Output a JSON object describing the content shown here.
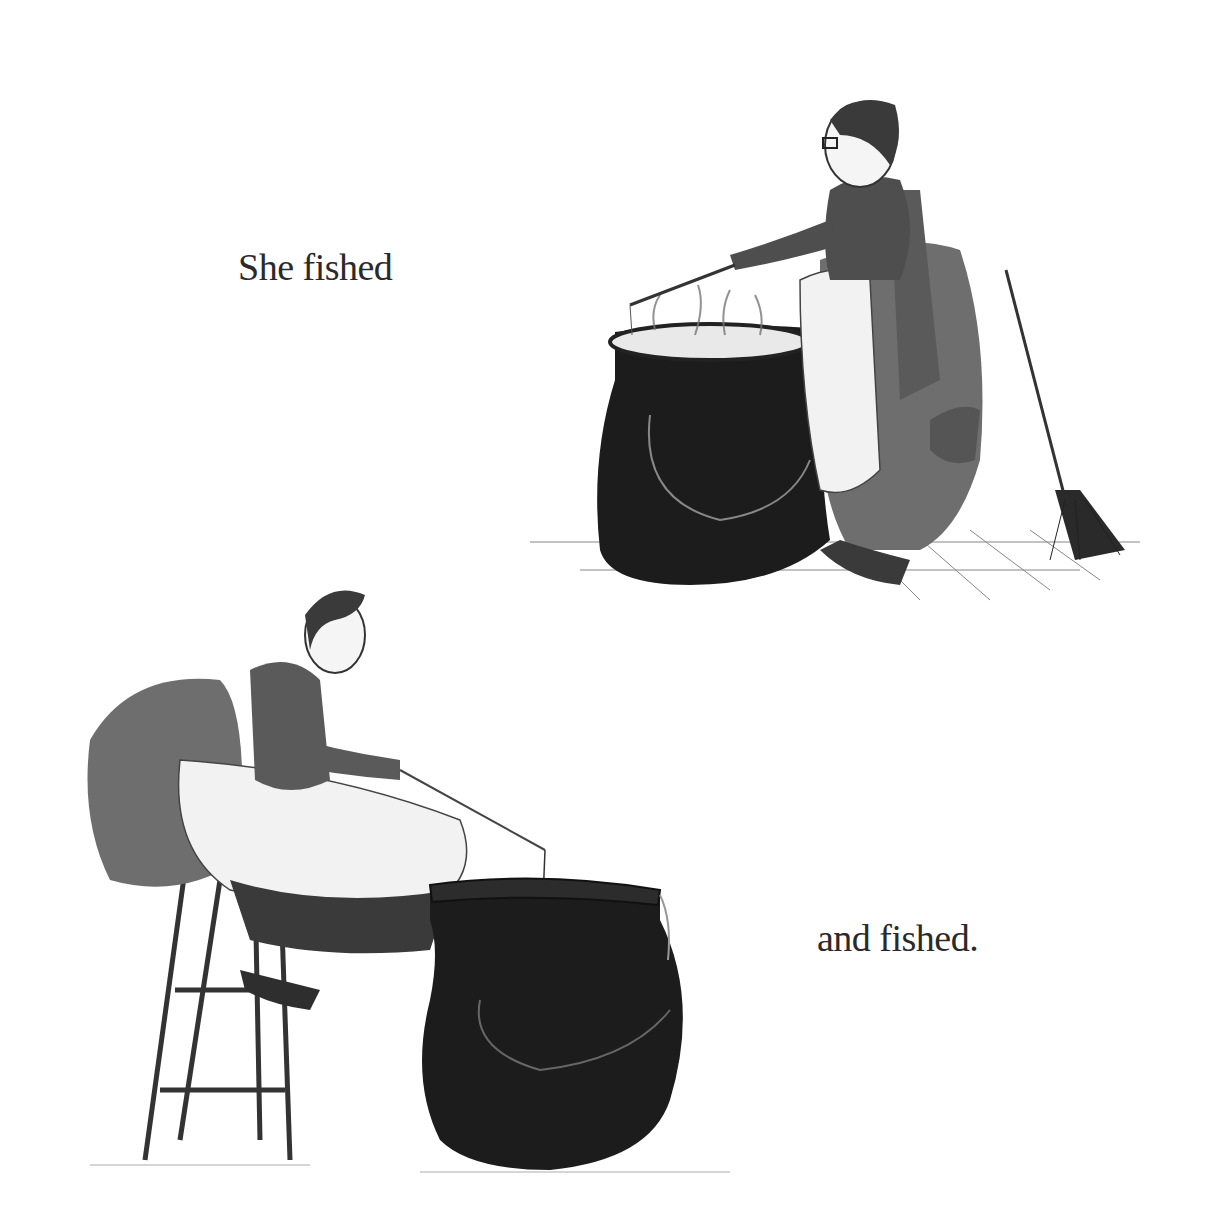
{
  "page": {
    "background": "#ffffff",
    "text_color": "#2a2a2a"
  },
  "captions": [
    {
      "text": "She fished"
    },
    {
      "text": "and fished."
    }
  ],
  "illustrations": [
    {
      "label": "Witch standing, fishing in a steaming cauldron with a stick, broom leaning nearby",
      "elements": [
        "witch-standing",
        "cauldron-steaming",
        "fishing-stick",
        "broom",
        "tiled-floor"
      ]
    },
    {
      "label": "Witch sitting on a tall stool, fishing into a large black cauldron with a rod and line",
      "elements": [
        "witch-sitting",
        "tall-stool",
        "fishing-rod",
        "fishing-line",
        "cauldron-large"
      ]
    }
  ],
  "colors": {
    "ink": "#1a1a1a",
    "cauldron": "#1c1c1c",
    "cloth_gray": "#6e6e6e",
    "apron": "#f2f2f2"
  }
}
